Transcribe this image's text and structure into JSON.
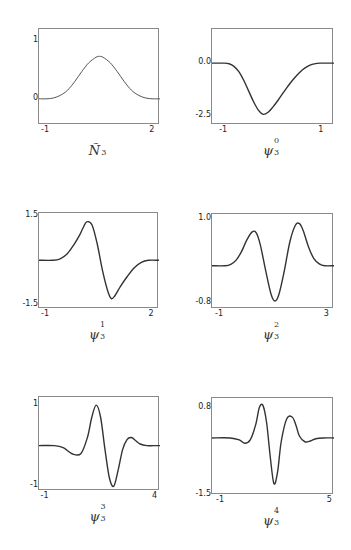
{
  "chart_data": [
    {
      "type": "line",
      "title": "Ñ3",
      "caption_base": "Ñ",
      "caption_sub": "3",
      "caption_sup": "",
      "xlim": [
        -1.2,
        2.2
      ],
      "ylim": [
        -0.45,
        1.2
      ],
      "xticks": [
        {
          "v": -1,
          "label": "-1"
        },
        {
          "v": 2,
          "label": "2"
        }
      ],
      "yticks": [
        {
          "v": 1,
          "label": "1"
        },
        {
          "v": 0,
          "label": "0"
        }
      ],
      "frame": {
        "left": 38,
        "top": 28,
        "width": 121,
        "height": 96
      },
      "series": [
        {
          "name": "N3",
          "x": [
            -1.2,
            -1.0,
            -0.8,
            -0.6,
            -0.4,
            -0.2,
            0.0,
            0.2,
            0.4,
            0.5,
            0.6,
            0.8,
            1.0,
            1.2,
            1.4,
            1.6,
            1.8,
            2.0,
            2.2
          ],
          "y": [
            0,
            0,
            0.0133,
            0.06,
            0.1467,
            0.2933,
            0.4667,
            0.62,
            0.7133,
            0.73,
            0.7133,
            0.62,
            0.4667,
            0.2933,
            0.1467,
            0.06,
            0.0133,
            0,
            0
          ]
        }
      ]
    },
    {
      "type": "line",
      "title": "ψ3^0",
      "caption_base": "ψ",
      "caption_sub": "3",
      "caption_sup": "0",
      "xlim": [
        -1.25,
        1.25
      ],
      "ylim": [
        -2.9,
        1.6
      ],
      "xticks": [
        {
          "v": -1,
          "label": "-1"
        },
        {
          "v": 1,
          "label": "1"
        }
      ],
      "yticks": [
        {
          "v": 0,
          "label": "0.0"
        },
        {
          "v": -2.5,
          "label": "-2.5"
        }
      ],
      "frame": {
        "left": 211,
        "top": 28,
        "width": 122,
        "height": 96
      },
      "series": [
        {
          "name": "psi0",
          "x": [
            -1.25,
            -1.0,
            -0.9,
            -0.8,
            -0.7,
            -0.6,
            -0.5,
            -0.4,
            -0.3,
            -0.2,
            -0.1,
            0.0,
            0.1,
            0.2,
            0.3,
            0.4,
            0.5,
            0.6,
            0.7,
            0.8,
            0.9,
            1.0,
            1.25
          ],
          "y": [
            0,
            0,
            -0.03,
            -0.15,
            -0.4,
            -0.8,
            -1.3,
            -1.8,
            -2.2,
            -2.4,
            -2.3,
            -2.05,
            -1.75,
            -1.42,
            -1.1,
            -0.8,
            -0.54,
            -0.32,
            -0.16,
            -0.06,
            -0.01,
            0,
            0
          ]
        }
      ]
    },
    {
      "type": "line",
      "title": "ψ3^1",
      "caption_base": "ψ",
      "caption_sub": "3",
      "caption_sup": "1",
      "xlim": [
        -1.2,
        2.2
      ],
      "ylim": [
        -1.65,
        1.6
      ],
      "xticks": [
        {
          "v": -1,
          "label": "-1"
        },
        {
          "v": 2,
          "label": "2"
        }
      ],
      "yticks": [
        {
          "v": 1.5,
          "label": "1.5"
        },
        {
          "v": -1.5,
          "label": "-1.5"
        }
      ],
      "frame": {
        "left": 38,
        "top": 212,
        "width": 120,
        "height": 96
      },
      "series": [
        {
          "name": "psi1",
          "x": [
            -1.2,
            -0.8,
            -0.6,
            -0.4,
            -0.2,
            -0.05,
            0.05,
            0.15,
            0.3,
            0.45,
            0.6,
            0.75,
            0.85,
            0.95,
            1.1,
            1.3,
            1.5,
            1.7,
            1.9,
            2.2
          ],
          "y": [
            0,
            0,
            0.05,
            0.22,
            0.55,
            0.85,
            1.1,
            1.3,
            1.2,
            0.55,
            -0.35,
            -1.05,
            -1.3,
            -1.2,
            -0.9,
            -0.55,
            -0.25,
            -0.07,
            0,
            0
          ]
        }
      ]
    },
    {
      "type": "line",
      "title": "ψ3^2",
      "caption_base": "ψ",
      "caption_sub": "3",
      "caption_sup": "2",
      "xlim": [
        -1.3,
        3.25
      ],
      "ylim": [
        -0.92,
        1.1
      ],
      "xticks": [
        {
          "v": -1,
          "label": "-1"
        },
        {
          "v": 3,
          "label": "3"
        }
      ],
      "yticks": [
        {
          "v": 1.0,
          "label": "1.0"
        },
        {
          "v": -0.8,
          "label": "-0.8"
        }
      ],
      "frame": {
        "left": 211,
        "top": 213,
        "width": 122,
        "height": 95
      },
      "series": [
        {
          "name": "psi2",
          "x": [
            -1.3,
            -0.8,
            -0.6,
            -0.4,
            -0.2,
            0.0,
            0.2,
            0.35,
            0.5,
            0.7,
            0.9,
            1.05,
            1.2,
            1.4,
            1.6,
            1.8,
            1.95,
            2.1,
            2.3,
            2.5,
            2.7,
            2.9,
            3.25
          ],
          "y": [
            0,
            0,
            0.03,
            0.12,
            0.3,
            0.55,
            0.72,
            0.7,
            0.45,
            -0.1,
            -0.6,
            -0.75,
            -0.6,
            -0.1,
            0.5,
            0.85,
            0.9,
            0.75,
            0.4,
            0.15,
            0.04,
            0,
            0
          ]
        }
      ]
    },
    {
      "type": "line",
      "title": "ψ3^3",
      "caption_base": "ψ",
      "caption_sub": "3",
      "caption_sup": "3",
      "xlim": [
        -1.3,
        4.2
      ],
      "ylim": [
        -1.12,
        1.2
      ],
      "xticks": [
        {
          "v": -1,
          "label": "-1"
        },
        {
          "v": 4,
          "label": "4"
        }
      ],
      "yticks": [
        {
          "v": 1,
          "label": "1"
        },
        {
          "v": -1,
          "label": "-1"
        }
      ],
      "frame": {
        "left": 38,
        "top": 396,
        "width": 121,
        "height": 94
      },
      "series": [
        {
          "name": "psi3",
          "x": [
            -1.3,
            -0.6,
            -0.2,
            0.2,
            0.6,
            0.9,
            1.1,
            1.3,
            1.5,
            1.7,
            1.9,
            2.1,
            2.3,
            2.5,
            2.7,
            2.9,
            3.1,
            3.3,
            3.6,
            3.9,
            4.2
          ],
          "y": [
            0,
            0,
            -0.05,
            -0.2,
            -0.2,
            0.2,
            0.7,
            1.0,
            0.7,
            -0.1,
            -0.8,
            -1.0,
            -0.6,
            -0.1,
            0.15,
            0.2,
            0.12,
            0.04,
            0,
            0,
            0
          ]
        }
      ]
    },
    {
      "type": "line",
      "title": "ψ3^4",
      "caption_base": "ψ",
      "caption_sub": "3",
      "caption_sup": "4",
      "xlim": [
        -1.5,
        5.2
      ],
      "ylim": [
        -1.5,
        1.05
      ],
      "xticks": [
        {
          "v": -1,
          "label": "-1"
        },
        {
          "v": 5,
          "label": "5"
        }
      ],
      "yticks": [
        {
          "v": 0.8,
          "label": "0.8"
        },
        {
          "v": -1.5,
          "label": "-1.5"
        }
      ],
      "frame": {
        "left": 211,
        "top": 397,
        "width": 122,
        "height": 97
      },
      "series": [
        {
          "name": "psi4",
          "x": [
            -1.5,
            -0.5,
            0.0,
            0.3,
            0.6,
            0.9,
            1.1,
            1.3,
            1.5,
            1.7,
            1.9,
            2.1,
            2.3,
            2.6,
            2.9,
            3.1,
            3.3,
            3.6,
            3.9,
            4.2,
            4.6,
            5.2
          ],
          "y": [
            0,
            0,
            -0.05,
            -0.14,
            -0.05,
            0.35,
            0.8,
            0.85,
            0.4,
            -0.5,
            -1.2,
            -0.9,
            -0.1,
            0.5,
            0.55,
            0.35,
            0.05,
            -0.1,
            -0.08,
            -0.02,
            0,
            0
          ]
        }
      ]
    }
  ]
}
